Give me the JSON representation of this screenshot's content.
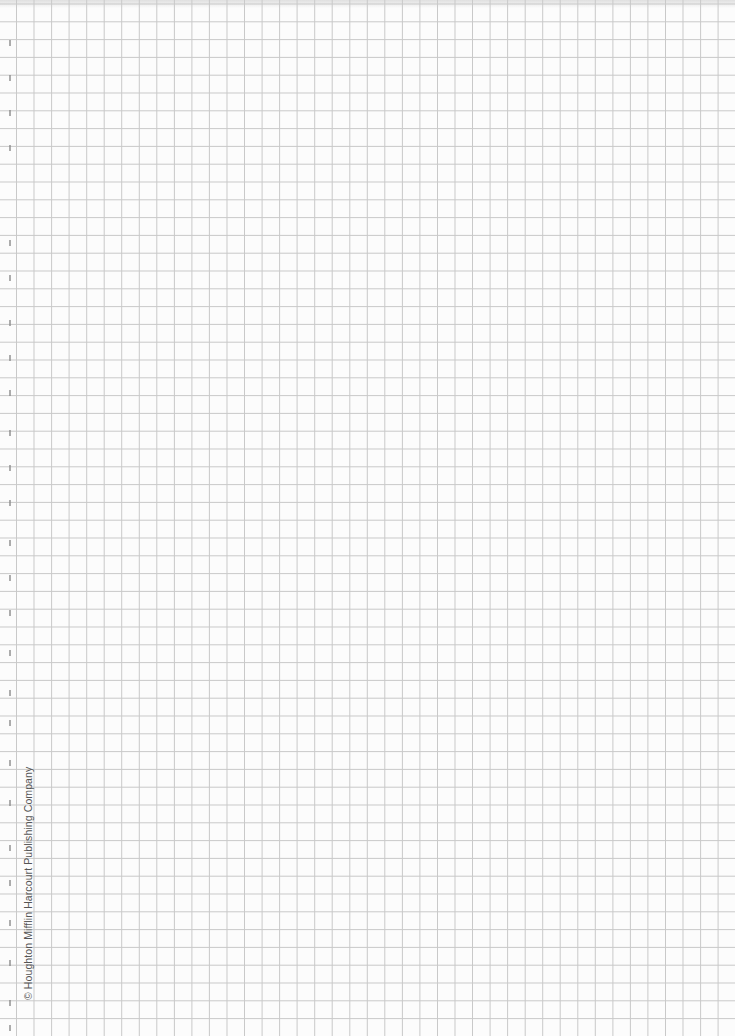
{
  "page": {
    "type": "graph-paper",
    "background_color": "#fcfcfc",
    "grid": {
      "line_color": "#c9c9c9",
      "x_start": 16.5,
      "x_spacing": 17.54,
      "columns_lines": 41,
      "y_start": 4,
      "y_spacing": 17.8,
      "row_lines": 58
    }
  },
  "footer": {
    "copyright": "© Houghton Mifflin Harcourt Publishing Company"
  },
  "margin_marks_y": [
    40,
    75,
    110,
    145,
    240,
    275,
    320,
    355,
    390,
    430,
    465,
    500,
    540,
    575,
    610,
    650,
    690,
    720,
    760,
    800,
    845,
    880,
    920,
    960,
    1000,
    1025
  ]
}
